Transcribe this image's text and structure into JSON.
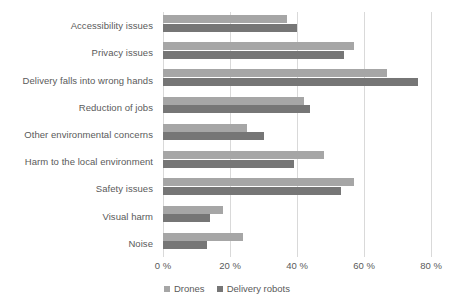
{
  "chart_data": {
    "type": "bar",
    "orientation": "horizontal",
    "title": "",
    "subtitle": "",
    "xlabel": "",
    "ylabel": "",
    "categories": [
      "Accessibility issues",
      "Privacy issues",
      "Delivery falls into wrong hands",
      "Reduction of jobs",
      "Other environmental concerns",
      "Harm to the local environment",
      "Safety issues",
      "Visual harm",
      "Noise"
    ],
    "series": [
      {
        "name": "Drones",
        "color": "#a6a6a6",
        "values": [
          37,
          57,
          67,
          42,
          25,
          48,
          57,
          18,
          24
        ]
      },
      {
        "name": "Delivery robots",
        "color": "#767676",
        "values": [
          40,
          54,
          76,
          44,
          30,
          39,
          53,
          14,
          13
        ]
      }
    ],
    "xlim": [
      0,
      80
    ],
    "xticks": [
      0,
      20,
      40,
      60,
      80
    ],
    "xtick_labels": [
      "0 %",
      "20 %",
      "40 %",
      "60 %",
      "80 %"
    ],
    "grid": "vertical",
    "legend_position": "bottom",
    "legend_entries": [
      "Drones",
      "Delivery robots"
    ]
  },
  "axis": {
    "tick_suffix": "%"
  },
  "colors": {
    "drones": "#a6a6a6",
    "delivery_robots": "#767676",
    "gridline": "#d9d9d9",
    "text": "#5a5a5a",
    "background": "#ffffff"
  }
}
